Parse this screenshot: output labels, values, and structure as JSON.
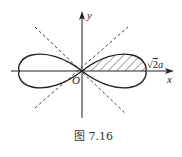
{
  "diagram": {
    "type": "lemniscate",
    "axis_labels": {
      "x": "x",
      "y": "y",
      "origin": "O"
    },
    "intercept_label": "√2a",
    "intercept_label_parts": {
      "root": "√",
      "radicand": "2",
      "var": "a"
    },
    "caption": "图 7.16",
    "asymptote_lines": [
      "y = x",
      "y = -x"
    ],
    "shaded_region": "first-quadrant half of right loop",
    "colors": {
      "stroke": "#222222",
      "dashed": "#444444",
      "hatch": "#333333"
    }
  }
}
